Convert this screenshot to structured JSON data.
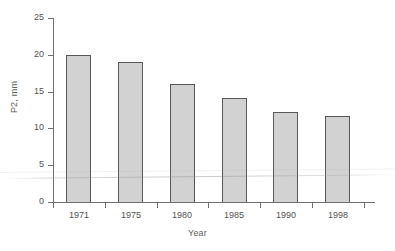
{
  "chart_data": {
    "type": "bar",
    "title": "",
    "xlabel": "Year",
    "ylabel": "P2, mm",
    "categories": [
      "1971",
      "1975",
      "1980",
      "1985",
      "1990",
      "1998"
    ],
    "values": [
      20.0,
      19.0,
      16.1,
      14.1,
      12.2,
      11.7
    ],
    "ylim": [
      0,
      25
    ],
    "yticks": [
      0,
      5,
      10,
      15,
      20,
      25
    ],
    "ytick_labels": [
      "0",
      "5",
      "10",
      "15",
      "20",
      "25"
    ],
    "grid": false,
    "legend": null,
    "legend_position": "none",
    "series": [
      {
        "name": "P2",
        "values": [
          20.0,
          19.0,
          16.1,
          14.1,
          12.2,
          11.7
        ]
      }
    ],
    "colors": {
      "bar_fill": "#d2d2d2",
      "bar_edge": "#585858",
      "axis": "#6f6f6f",
      "text": "#545454",
      "background": "#ffffff"
    }
  }
}
